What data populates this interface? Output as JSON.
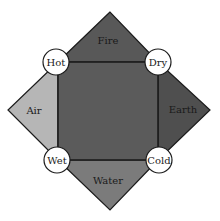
{
  "diagram": {
    "title": "",
    "elements": [
      {
        "id": "fire",
        "label": "Fire",
        "position": "top",
        "color": "#585858"
      },
      {
        "id": "earth",
        "label": "Earth",
        "position": "right",
        "color": "#4f4f4f"
      },
      {
        "id": "water",
        "label": "Water",
        "position": "bottom",
        "color": "#7b7b7b"
      },
      {
        "id": "air",
        "label": "Air",
        "position": "left",
        "color": "#b6b6b6"
      }
    ],
    "qualities": [
      {
        "id": "hot",
        "label": "Hot",
        "corner": "top-left"
      },
      {
        "id": "dry",
        "label": "Dry",
        "corner": "top-right"
      },
      {
        "id": "wet",
        "label": "Wet",
        "corner": "bottom-left"
      },
      {
        "id": "cold",
        "label": "Cold",
        "corner": "bottom-right"
      }
    ],
    "center_color": "#5b5b5b",
    "line_color": "#1c1c1c"
  }
}
